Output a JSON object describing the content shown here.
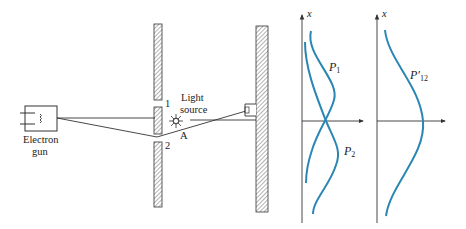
{
  "diagram": {
    "colors": {
      "curve": "#2a86b3",
      "line": "#333333",
      "hatch": "#555555"
    },
    "labels": {
      "gun_line1": "Electron",
      "gun_line2": "gun",
      "slit1": "1",
      "slit2": "2",
      "light_line1": "Light",
      "light_line2": "source",
      "point_a": "A"
    },
    "graph_left": {
      "axis_label": "x",
      "curve1_label": "P",
      "curve1_sub": "1",
      "curve2_label": "P",
      "curve2_sub": "2"
    },
    "graph_right": {
      "axis_label": "x",
      "curve_label": "P′",
      "curve_sub": "12"
    }
  }
}
